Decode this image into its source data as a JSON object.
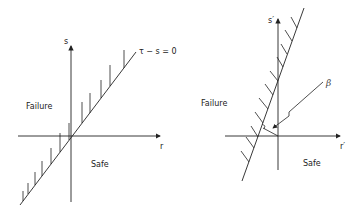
{
  "left_diagram": {
    "x_axis_label": "r",
    "y_axis_label": "s",
    "limit_state_label": "τ − s = 0",
    "failure_label": "Failure",
    "safe_label": "Safe"
  },
  "right_diagram": {
    "x_axis_label": "r′",
    "y_axis_label": "s′",
    "beta_label": "β",
    "failure_label": "Failure",
    "safe_label": "Safe"
  },
  "colors": {
    "stroke": "#222222",
    "background": "#ffffff"
  }
}
